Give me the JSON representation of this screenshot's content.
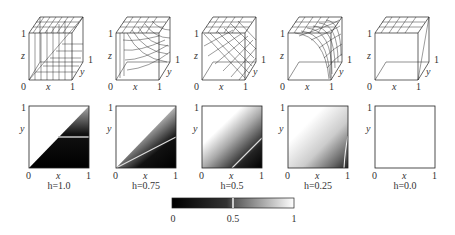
{
  "figure": {
    "panels": [
      {
        "h_label": "h=1.0",
        "h": 1.0
      },
      {
        "h_label": "h=0.75",
        "h": 0.75
      },
      {
        "h_label": "h=0.5",
        "h": 0.5
      },
      {
        "h_label": "h=0.25",
        "h": 0.25
      },
      {
        "h_label": "h=0.0",
        "h": 0.0
      }
    ],
    "cube_axes": {
      "x": "x",
      "y": "y",
      "z": "z",
      "zero": "0",
      "one": "1"
    },
    "square_axes": {
      "x": "x",
      "y": "y",
      "zero": "0",
      "one": "1"
    },
    "colorbar": {
      "min": "0",
      "mid": "0.5",
      "max": "1",
      "from_color": "#000000",
      "to_color": "#ffffff"
    }
  }
}
